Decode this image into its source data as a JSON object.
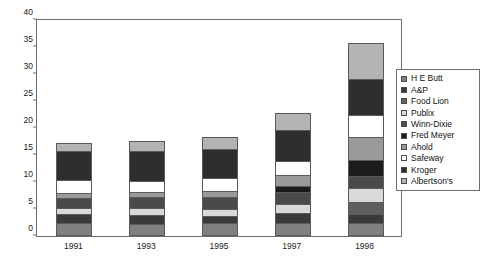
{
  "chart_data": {
    "type": "bar",
    "subtype": "stacked-bar",
    "title": "",
    "xlabel": "",
    "ylabel": "",
    "categories": [
      "1991",
      "1993",
      "1995",
      "1997",
      "1998"
    ],
    "ylim": [
      0,
      40
    ],
    "yticks": [
      0,
      5,
      10,
      15,
      20,
      25,
      30,
      35,
      40
    ],
    "grid": false,
    "legend_position": "right",
    "stack_order_bottom_to_top": [
      "Albertson's",
      "Kroger",
      "Safeway",
      "Ahold",
      "Fred Meyer",
      "Winn-Dixie",
      "Publix",
      "Food Lion",
      "A&P",
      "H E Butt"
    ],
    "series": [
      {
        "name": "H E Butt",
        "color": "#808080",
        "values": [
          2.1,
          1.8,
          2.0,
          2.1,
          2.1
        ]
      },
      {
        "name": "A&P",
        "color": "#3a3a3a",
        "values": [
          1.6,
          1.7,
          1.4,
          1.8,
          1.6
        ]
      },
      {
        "name": "Food Lion",
        "color": "#5e5e5e",
        "values": [
          0.0,
          0.0,
          0.0,
          0.0,
          2.3
        ]
      },
      {
        "name": "Publix",
        "color": "#d9d9d9",
        "values": [
          1.1,
          1.3,
          1.3,
          1.7,
          2.5
        ]
      },
      {
        "name": "Winn-Dixie",
        "color": "#4a4a4a",
        "values": [
          1.9,
          2.0,
          2.1,
          2.2,
          2.3
        ]
      },
      {
        "name": "Fred Meyer",
        "color": "#1c1c1c",
        "values": [
          0.0,
          0.0,
          0.0,
          1.1,
          3.0
        ]
      },
      {
        "name": "Ahold",
        "color": "#9a9a9a",
        "values": [
          0.9,
          1.0,
          1.2,
          2.1,
          4.1
        ]
      },
      {
        "name": "Safeway",
        "color": "#ffffff",
        "values": [
          2.4,
          2.1,
          2.3,
          2.6,
          4.2
        ]
      },
      {
        "name": "Kroger",
        "color": "#2e2e2e",
        "values": [
          5.3,
          5.4,
          5.5,
          5.7,
          6.7
        ]
      },
      {
        "name": "Albertson's",
        "color": "#b3b3b3",
        "values": [
          1.6,
          1.9,
          2.1,
          3.1,
          6.5
        ]
      }
    ],
    "totals": [
      20.7,
      22.0,
      23.3,
      27.4,
      38.0
    ]
  },
  "legend": {
    "items": [
      {
        "label": "H E Butt"
      },
      {
        "label": "A&P"
      },
      {
        "label": "Food Lion"
      },
      {
        "label": "Publix"
      },
      {
        "label": "Winn-Dixie"
      },
      {
        "label": "Fred Meyer"
      },
      {
        "label": "Ahold"
      },
      {
        "label": "Safeway"
      },
      {
        "label": "Kroger"
      },
      {
        "label": "Albertson's"
      }
    ]
  },
  "colors": {
    "axis": "#6e6e6e",
    "bar_outline": "#5a5a5a",
    "text": "#1a1a1a",
    "background": "#ffffff"
  }
}
